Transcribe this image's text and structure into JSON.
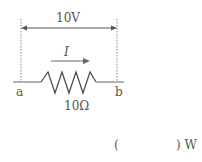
{
  "diagram": {
    "voltage_label": "10V",
    "current_label": "I",
    "node_a": "a",
    "node_b": "b",
    "resistance_label": "10Ω",
    "answer_open": "(",
    "answer_close": ") W"
  },
  "colors": {
    "line": "#666666",
    "text": "#555555"
  }
}
